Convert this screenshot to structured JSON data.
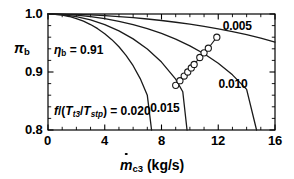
{
  "chart_data": {
    "type": "line",
    "title": "",
    "xlabel": "ṁ_c3 (kg/s)",
    "ylabel": "π_b",
    "xlim": [
      0,
      16
    ],
    "ylim": [
      0.8,
      1.0
    ],
    "xticks": [
      0,
      4,
      8,
      12,
      16
    ],
    "xticklabels": [
      "0",
      "4",
      "8",
      "12",
      "16"
    ],
    "yticks": [
      0.8,
      0.9,
      1.0
    ],
    "yticklabels": [
      "0.8",
      "0.9",
      "1.0"
    ],
    "grid": false,
    "legend_position": "inline-curve-labels",
    "annotations": [
      {
        "name": "efficiency",
        "text": "ηb = 0.91",
        "x": 1.0,
        "y": 0.945
      },
      {
        "name": "fuel-parameter",
        "text": "f/(Tt3/Tstp) = 0.020",
        "x": 1.0,
        "y": 0.836
      }
    ],
    "series": [
      {
        "name": "0.005",
        "label": "0.005",
        "label_x": 13.3,
        "label_y": 0.977,
        "x": [
          0,
          1,
          2,
          3,
          4,
          5,
          6,
          7,
          8,
          9,
          10,
          11,
          12,
          13,
          14,
          15,
          16
        ],
        "y": [
          1.0,
          0.9998,
          0.9993,
          0.9984,
          0.9972,
          0.9956,
          0.9937,
          0.9914,
          0.9888,
          0.9858,
          0.9824,
          0.9787,
          0.9745,
          0.9698,
          0.9645,
          0.9585,
          0.9516
        ]
      },
      {
        "name": "0.010",
        "label": "0.010",
        "label_x": 13.0,
        "label_y": 0.878,
        "x": [
          0,
          1,
          2,
          3,
          4,
          5,
          6,
          7,
          8,
          9,
          10,
          11,
          12,
          13,
          14,
          14.7
        ],
        "y": [
          1.0,
          0.9995,
          0.998,
          0.9955,
          0.992,
          0.9874,
          0.9817,
          0.9748,
          0.9665,
          0.9567,
          0.9451,
          0.9314,
          0.915,
          0.8951,
          0.8701,
          0.8
        ]
      },
      {
        "name": "0.015",
        "label": "0.015",
        "label_x": 8.2,
        "label_y": 0.836,
        "x": [
          0,
          1,
          2,
          3,
          4,
          5,
          6,
          7,
          8,
          9,
          9.5,
          9.8
        ],
        "y": [
          1.0,
          0.9989,
          0.9956,
          0.9899,
          0.9818,
          0.971,
          0.9571,
          0.9395,
          0.9171,
          0.8878,
          0.866,
          0.8
        ]
      },
      {
        "name": "0.020",
        "label": "",
        "label_x": null,
        "label_y": null,
        "x": [
          0,
          0.5,
          1,
          1.5,
          2,
          2.5,
          3,
          3.5,
          4,
          4.5,
          5,
          5.5,
          6,
          6.5,
          7,
          7.3
        ],
        "y": [
          1.0,
          0.9995,
          0.9981,
          0.9957,
          0.9922,
          0.9876,
          0.9818,
          0.9747,
          0.9661,
          0.9558,
          0.9435,
          0.9287,
          0.9108,
          0.8886,
          0.8598,
          0.8
        ]
      }
    ],
    "markers": {
      "name": "operating-line",
      "style": "open-circle",
      "x": [
        9.0,
        9.3,
        9.6,
        9.85,
        10.1,
        10.3,
        10.7,
        11.0,
        11.3,
        11.9
      ],
      "y": [
        0.877,
        0.885,
        0.893,
        0.9,
        0.907,
        0.913,
        0.925,
        0.933,
        0.941,
        0.96
      ]
    }
  },
  "figure": {
    "xaxis_title_main": "m",
    "xaxis_title_sub": "c3",
    "xaxis_title_units": " (kg/s)",
    "yaxis_title_main": "π",
    "yaxis_title_sub": "b",
    "eta_symbol": "η",
    "eta_sub": "b",
    "eta_value": " = 0.91",
    "fuel_f": "f",
    "fuel_open": "/(",
    "fuel_T1": "T",
    "fuel_T1_sub": "t3",
    "fuel_slash": "/",
    "fuel_T2": "T",
    "fuel_T2_sub": "stp",
    "fuel_close": ")",
    "fuel_value": " = 0.020",
    "axis_color": "#000000",
    "curve_color": "#1a1a1a",
    "marker_fill": "#ffffff"
  }
}
